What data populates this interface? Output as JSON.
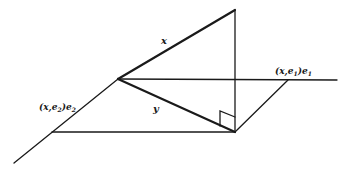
{
  "diagram": {
    "title": "",
    "labels": {
      "vector_x": "x",
      "vector_y": "y",
      "projection_e1": "(x,e",
      "projection_e1_sub": "1",
      "projection_e1_tail": ")e",
      "projection_e1_tail_sub": "1",
      "projection_e2": "(x,e",
      "projection_e2_sub": "2",
      "projection_e2_tail": ")e",
      "projection_e2_tail_sub": "2"
    },
    "elements": [
      {
        "id": "axis-e2",
        "description": "oblique axis along e2 direction"
      },
      {
        "id": "axis-e1",
        "description": "horizontal axis along e1 direction"
      },
      {
        "id": "vector-x",
        "description": "vector x from origin to top point"
      },
      {
        "id": "vector-y",
        "description": "projection y of x onto the plane"
      },
      {
        "id": "perpendicular",
        "description": "vertical drop from x tip to y tip"
      },
      {
        "id": "right-angle-marker",
        "description": "right angle symbol at foot of perpendicular"
      },
      {
        "id": "parallelogram",
        "description": "plane spanned by e1 and e2 components"
      }
    ],
    "colors": {
      "stroke": "#1a1a1a",
      "background": "#ffffff"
    }
  }
}
